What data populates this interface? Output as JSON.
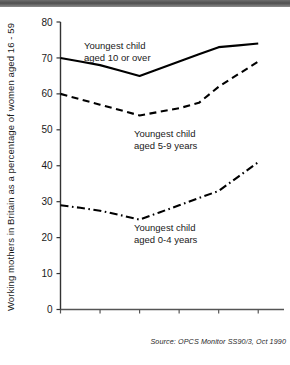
{
  "figure": {
    "source_note": "Source: OPCS Monitor SS90/3, Oct 1990",
    "ylabel": "Working mothers in Britain as a percentage of women aged 16 - 59"
  },
  "chart_data": {
    "type": "line",
    "title": "",
    "subtitle": "",
    "xlabel": "",
    "ylabel": "Working mothers in Britain as a percentage of women aged 16 - 59",
    "xlim": [
      1979,
      1990
    ],
    "ylim": [
      0,
      80
    ],
    "ytick_labels": [
      "0",
      "10",
      "20",
      "30",
      "40",
      "50",
      "60",
      "70",
      "80"
    ],
    "yticks": [
      0,
      10,
      20,
      30,
      40,
      50,
      60,
      70,
      80
    ],
    "xtick_labels": [
      "1979",
      "1981",
      "1983",
      "1985",
      "1987",
      "1989"
    ],
    "xticks": [
      1979,
      1981,
      1983,
      1985,
      1987,
      1989
    ],
    "grid": false,
    "legend_position": "inline-annotations",
    "x": [
      1979,
      1980,
      1981,
      1982,
      1983,
      1984,
      1985,
      1986,
      1987,
      1988,
      1989
    ],
    "series": [
      {
        "name": "Youngest child aged 10 or over",
        "style": "solid",
        "color": "#000000",
        "values": [
          70,
          69,
          68,
          66.5,
          65,
          67,
          69,
          71,
          73,
          73.5,
          74
        ]
      },
      {
        "name": "Youngest child aged 5-9 years",
        "style": "dashed",
        "color": "#000000",
        "values": [
          60,
          58.5,
          57,
          55.5,
          54,
          55,
          56,
          57.5,
          62,
          65.5,
          69
        ]
      },
      {
        "name": "Youngest child aged 0-4 years",
        "style": "dash-dot",
        "color": "#000000",
        "values": [
          29,
          28.3,
          27.5,
          26.3,
          25,
          27,
          29,
          31,
          33,
          37,
          41
        ]
      }
    ],
    "annotations": [
      {
        "text_line1": "Youngest child",
        "text_line2": "aged 10 or over"
      },
      {
        "text_line1": "Youngest child",
        "text_line2": "aged 5-9 years"
      },
      {
        "text_line1": "Youngest child",
        "text_line2": "aged 0-4 years"
      }
    ]
  }
}
